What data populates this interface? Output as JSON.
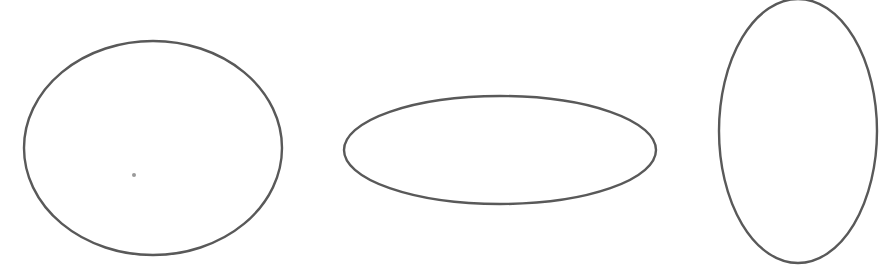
{
  "diagram": {
    "background_color": "#ffffff",
    "stroke_color": "#595959",
    "dot_color": "#9a9a9a",
    "shapes": [
      {
        "type": "ellipse",
        "name": "ellipse-left",
        "description": "slightly wide ellipse (near-circle)"
      },
      {
        "type": "ellipse",
        "name": "ellipse-center",
        "description": "flat horizontal ellipse"
      },
      {
        "type": "ellipse",
        "name": "ellipse-right",
        "description": "tall vertical ellipse"
      }
    ],
    "marks": [
      {
        "type": "dot",
        "name": "center-dot",
        "description": "small grey dot inside left ellipse"
      }
    ]
  }
}
